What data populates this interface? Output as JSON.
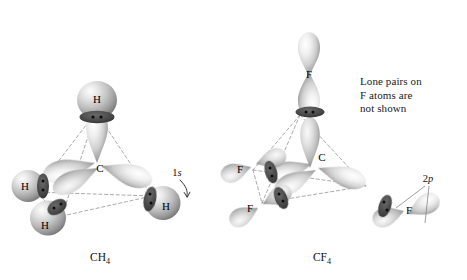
{
  "figure": {
    "kind": "orbital-overlap-diagram",
    "background": "#ffffff",
    "panels": [
      {
        "id": "ch4",
        "formula_text": "CH",
        "formula_sub": "4",
        "center_atom": "C",
        "ligand_atom": "H",
        "ligand_count": 4,
        "ligand_orbital_label_num": "1",
        "ligand_orbital_label_letter": "s",
        "bonding_pairs_per_bond": 2,
        "geometry": "tetrahedral"
      },
      {
        "id": "cf4",
        "formula_text": "CF",
        "formula_sub": "4",
        "center_atom": "C",
        "ligand_atom": "F",
        "ligand_count": 4,
        "ligand_orbital_label_num": "2",
        "ligand_orbital_label_letter": "p",
        "bonding_pairs_per_bond": 2,
        "geometry": "tetrahedral"
      }
    ],
    "note_text": "Lone pairs on\nF atoms are\nnot shown",
    "colors": {
      "orbital_light": "#f2f2f2",
      "orbital_mid": "#b9b9b9",
      "orbital_dark": "#7d7d7d",
      "overlap_band": "#4a4a4a",
      "electron_dot": "#0c0c0c",
      "dashed_edge": "#8e8e8e",
      "text": "#111111"
    },
    "labels": {
      "ch4_center": "C",
      "ch4_h_top": "H",
      "ch4_h_left_upper": "H",
      "ch4_h_left_lower": "H",
      "ch4_h_right": "H",
      "cf4_center": "C",
      "cf4_f_top": "F",
      "cf4_f_left_upper": "F",
      "cf4_f_left_lower": "F",
      "cf4_f_right": "F"
    }
  }
}
